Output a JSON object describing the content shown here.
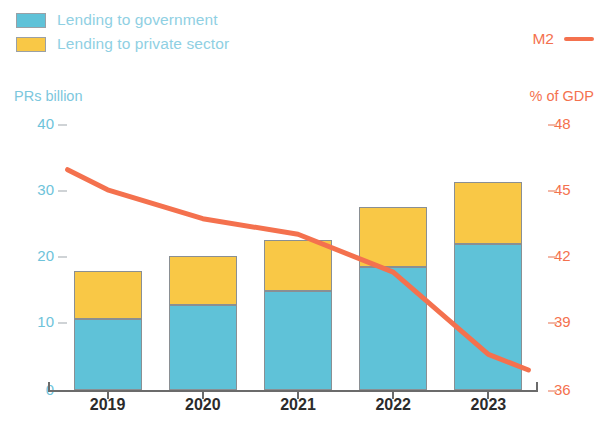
{
  "legend": {
    "items": [
      {
        "label": "Lending to government",
        "color": "#5FC2D8",
        "icon": "legend-swatch-icon"
      },
      {
        "label": "Lending to private sector",
        "color": "#F9C846",
        "icon": "legend-swatch-icon"
      }
    ],
    "line_series": {
      "label": "M2",
      "color": "#F4714E",
      "icon": "legend-line-icon"
    }
  },
  "axes": {
    "left_title": "PRs billion",
    "right_title": "% of GDP",
    "left_ticks": [
      "40",
      "30",
      "20",
      "10",
      "0"
    ],
    "right_ticks": [
      "48",
      "45",
      "42",
      "39",
      "36"
    ]
  },
  "chart_data": {
    "type": "bar",
    "title": "",
    "subtitle": "",
    "xlabel": "",
    "ylabel": "PRs billion",
    "y2label": "% of GDP",
    "categories": [
      "2019",
      "2020",
      "2021",
      "2022",
      "2023"
    ],
    "stacked": true,
    "grid": false,
    "legend_position": "top",
    "ylim": [
      0,
      40
    ],
    "ytick_values": [
      0,
      10,
      20,
      30,
      40
    ],
    "y2lim": [
      36,
      48
    ],
    "y2tick_values": [
      36,
      39,
      42,
      45,
      48
    ],
    "series": [
      {
        "name": "Lending to government",
        "color": "#5FC2D8",
        "axis": "left",
        "type": "bar",
        "values": [
          10.6,
          12.8,
          14.9,
          18.4,
          21.8
        ]
      },
      {
        "name": "Lending to private sector",
        "color": "#F9C846",
        "axis": "left",
        "type": "bar",
        "values": [
          7.3,
          7.3,
          7.6,
          9.0,
          9.3
        ]
      },
      {
        "name": "M2",
        "color": "#F4714E",
        "axis": "right",
        "type": "line",
        "values": [
          45.0,
          43.7,
          43.0,
          41.3,
          37.6
        ],
        "extends_before_first": true,
        "extends_after_last": true,
        "start_value": 45.9,
        "end_value": 36.9
      }
    ],
    "totals": [
      17.9,
      20.1,
      22.5,
      27.4,
      31.1
    ]
  }
}
